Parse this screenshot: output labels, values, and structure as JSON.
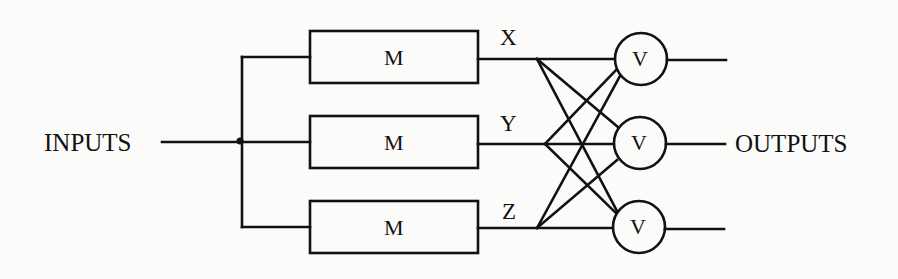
{
  "diagram": {
    "stroke_color": "#111111",
    "background": "#fbfbfa",
    "input_label": "INPUTS",
    "output_label": "OUTPUTS",
    "modules": [
      {
        "label": "M",
        "signal": "X"
      },
      {
        "label": "M",
        "signal": "Y"
      },
      {
        "label": "M",
        "signal": "Z"
      }
    ],
    "voters": [
      {
        "label": "V"
      },
      {
        "label": "V"
      },
      {
        "label": "V"
      }
    ],
    "connections": {
      "input_to_modules": [
        "INPUTS->M1",
        "INPUTS->M2",
        "INPUTS->M3"
      ],
      "modules_to_voters": [
        "X->V1",
        "X->V2",
        "X->V3",
        "Y->V1",
        "Y->V2",
        "Y->V3",
        "Z->V1",
        "Z->V2",
        "Z->V3"
      ],
      "voters_to_outputs": [
        "V1->OUTPUTS",
        "V2->OUTPUTS",
        "V3->OUTPUTS"
      ]
    }
  }
}
